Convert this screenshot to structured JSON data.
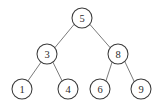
{
  "diagram": {
    "kind": "binary-search-tree",
    "background_color": "#ffffff",
    "node_fill_color": "#ffffff",
    "node_stroke_color": "#3a3a3a",
    "edge_color": "#6b6b6b",
    "label_color": "#2b2b2b",
    "node_radius": 10,
    "nodes": [
      {
        "id": "n5",
        "label": "5",
        "cx": 82,
        "cy": 18
      },
      {
        "id": "n3",
        "label": "3",
        "cx": 47,
        "cy": 54
      },
      {
        "id": "n8",
        "label": "8",
        "cx": 118,
        "cy": 54
      },
      {
        "id": "n1",
        "label": "1",
        "cx": 22,
        "cy": 89
      },
      {
        "id": "n4",
        "label": "4",
        "cx": 68,
        "cy": 89
      },
      {
        "id": "n6",
        "label": "6",
        "cx": 100,
        "cy": 89
      },
      {
        "id": "n9",
        "label": "9",
        "cx": 141,
        "cy": 89
      }
    ],
    "edges": [
      {
        "id": "e5-3",
        "from": "n5",
        "to": "n3",
        "x1": 74.2,
        "y1": 24.3,
        "x2": 54.8,
        "y2": 47.7
      },
      {
        "id": "e5-8",
        "from": "n5",
        "to": "n8",
        "x1": 89.8,
        "y1": 24.3,
        "x2": 110.2,
        "y2": 47.7
      },
      {
        "id": "e3-1",
        "from": "n3",
        "to": "n1",
        "x1": 41.1,
        "y1": 62.1,
        "x2": 27.9,
        "y2": 80.9
      },
      {
        "id": "e3-4",
        "from": "n3",
        "to": "n4",
        "x1": 52.9,
        "y1": 62.1,
        "x2": 62.1,
        "y2": 80.9
      },
      {
        "id": "e8-6",
        "from": "n8",
        "to": "n6",
        "x1": 112.0,
        "y1": 62.3,
        "x2": 106.0,
        "y2": 80.7
      },
      {
        "id": "e8-9",
        "from": "n8",
        "to": "n9",
        "x1": 124.8,
        "y1": 61.5,
        "x2": 134.2,
        "y2": 81.5
      }
    ]
  }
}
